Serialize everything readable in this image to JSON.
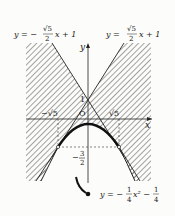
{
  "diagram": {
    "type": "function-graph",
    "colors": {
      "ink": "#222222",
      "hatch": "#555555",
      "background": "#fcfcfa"
    },
    "axes": {
      "x_label": "x",
      "y_label": "y",
      "origin_label": "O"
    },
    "tick_labels": {
      "y_intercept": "1",
      "neg_sqrt5": "−√5",
      "pos_sqrt5": "√5",
      "neg_three_halves_num": "3",
      "neg_three_halves_den": "2",
      "neg_three_halves_sign": "−"
    },
    "curves": [
      {
        "name": "left-line",
        "equation": "y = −(√5/2)x + 1",
        "label": {
          "lhs": "y = −",
          "num": "√5",
          "den": "2",
          "rhs": "x + 1"
        }
      },
      {
        "name": "right-line",
        "equation": "y = (√5/2)x + 1",
        "label": {
          "lhs": "y =",
          "num": "√5",
          "den": "2",
          "rhs": "x + 1"
        }
      },
      {
        "name": "parabola",
        "equation": "y = −(1/4)x² − 1/4",
        "label": {
          "lhs": "y = −",
          "num1": "1",
          "den1": "4",
          "mid": "x² −",
          "num2": "1",
          "den2": "4"
        }
      }
    ],
    "tangent_points": [
      {
        "x": "−√5",
        "y": "−3/2"
      },
      {
        "x": "√5",
        "y": "−3/2"
      }
    ],
    "shaded_region": "hatched region outside the V formed by the two lines and below/around the parabola"
  }
}
